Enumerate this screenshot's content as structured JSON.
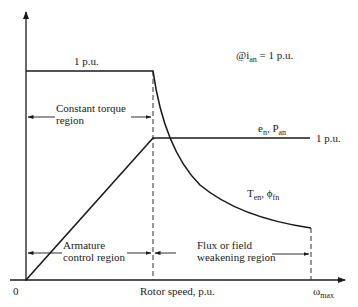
{
  "diagram": {
    "title_note": "@i",
    "title_note_sub": "an",
    "title_note_rest": " = 1 p.u.",
    "torque_level_label": "1 p.u.",
    "power_level_label": "1 p.u.",
    "power_curve_label": "e",
    "power_curve_label_sub1": "n",
    "power_curve_label_mid": ", P",
    "power_curve_label_sub2": "an",
    "torque_curve_label": "T",
    "torque_curve_label_sub1": "en",
    "torque_curve_label_mid": ", ϕ",
    "torque_curve_label_sub2": "fn",
    "region1_line1": "Constant torque",
    "region1_line2": "region",
    "region2_line1": "Armature",
    "region2_line2": "control region",
    "region3_line1": "Flux or field",
    "region3_line2": "weakening region",
    "x_axis_label": "Rotor speed, p.u.",
    "origin_label": "0",
    "x_max_label": "ω",
    "x_max_label_sub": "max"
  },
  "colors": {
    "line": "#1a1a1a",
    "text": "#222222",
    "background": "#ffffff"
  }
}
